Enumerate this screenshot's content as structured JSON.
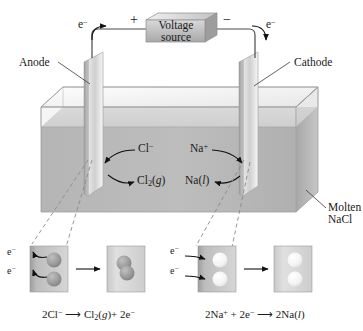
{
  "figure": {
    "circuit": {
      "voltage_source_line1": "Voltage",
      "voltage_source_line2": "source",
      "positive_terminal": "+",
      "negative_terminal": "−",
      "electron_left": "e−",
      "electron_right": "e−"
    },
    "electrodes": {
      "anode_label": "Anode",
      "cathode_label": "Cathode"
    },
    "cell": {
      "electrolyte_label_line1": "Molten",
      "electrolyte_label_line2": "NaCl"
    },
    "species": {
      "chloride_ion": "Cl−",
      "chlorine_gas": "Cl2(g)",
      "sodium_ion": "Na+",
      "sodium_liquid": "Na(l)"
    },
    "insets": {
      "left": {
        "electron_top": "e−",
        "electron_bottom": "e−",
        "reactant_particles": 2,
        "product_particles": 2,
        "particle_color": "#9a9a9a"
      },
      "right": {
        "electron_top": "e−",
        "electron_bottom": "e−",
        "reactant_particles": 2,
        "product_particles": 2,
        "particle_color": "#f2f2f2"
      }
    },
    "equations": {
      "anode_half_reaction": "2Cl− → Cl2(g) + 2e−",
      "cathode_half_reaction": "2Na+ + 2e− → 2Na(l)"
    },
    "colors": {
      "ink": "#1a1a1a",
      "melt_fill": "#b9b9b9",
      "glass": "#ededed",
      "electrode": "#cfcfcf",
      "dashed_leader": "#8a8a8a"
    }
  }
}
